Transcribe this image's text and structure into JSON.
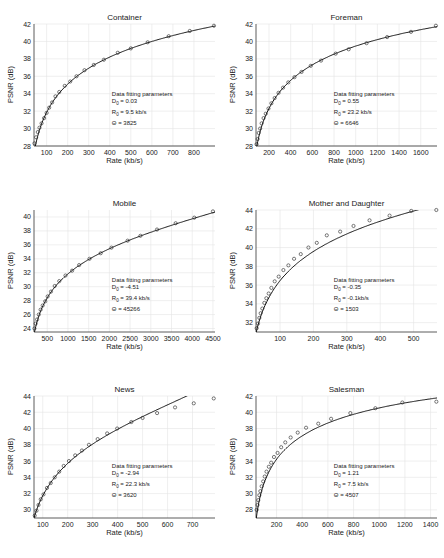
{
  "chart_data": [
    {
      "type": "scatter",
      "title": "Container",
      "xlabel": "Rate (kb/s)",
      "ylabel": "PSNR (dB)",
      "xlim": [
        40,
        900
      ],
      "ylim": [
        28,
        42
      ],
      "xticks": [
        100,
        200,
        300,
        400,
        500,
        600,
        700,
        800
      ],
      "yticks": [
        28,
        30,
        32,
        34,
        36,
        38,
        40,
        42
      ],
      "grid": true,
      "params": {
        "heading": "Data fitting parameters",
        "D0": "D0 = 0.03",
        "R0": "R0 = 9.5 kb/s",
        "theta": "Θ = 3825"
      },
      "fit": {
        "D0": 0.03,
        "R0": 9.5,
        "theta": 3825
      },
      "series": [
        {
          "name": "measured",
          "x": [
            42,
            50,
            58,
            66,
            76,
            88,
            100,
            112,
            126,
            142,
            160,
            186,
            212,
            242,
            280,
            324,
            372,
            438,
            500,
            580,
            680,
            780,
            895
          ],
          "y": [
            28.3,
            29.0,
            29.6,
            30.1,
            30.6,
            31.2,
            31.8,
            32.4,
            33.0,
            33.7,
            34.2,
            34.9,
            35.4,
            36.0,
            36.7,
            37.3,
            37.9,
            38.7,
            39.2,
            39.9,
            40.6,
            41.2,
            41.8
          ]
        }
      ]
    },
    {
      "type": "scatter",
      "title": "Foreman",
      "xlabel": "Rate (kb/s)",
      "ylabel": "PSNR (dB)",
      "xlim": [
        80,
        1750
      ],
      "ylim": [
        28,
        42
      ],
      "xticks": [
        200,
        400,
        600,
        800,
        1000,
        1200,
        1400,
        1600
      ],
      "yticks": [
        28,
        30,
        32,
        34,
        36,
        38,
        40,
        42
      ],
      "grid": true,
      "params": {
        "heading": "Data fitting parameters",
        "D0": "D0 = 0.55",
        "R0": "R0 = 23.2 kb/s",
        "theta": "Θ = 6646"
      },
      "fit": {
        "D0": 0.55,
        "R0": 23.2,
        "theta": 6646
      },
      "series": [
        {
          "name": "measured",
          "x": [
            85,
            95,
            105,
            118,
            132,
            150,
            170,
            195,
            222,
            252,
            288,
            330,
            378,
            435,
            500,
            585,
            680,
            815,
            935,
            1100,
            1290,
            1510,
            1740
          ],
          "y": [
            28.2,
            28.8,
            29.5,
            30.0,
            30.6,
            31.2,
            31.7,
            32.3,
            32.9,
            33.5,
            34.1,
            34.7,
            35.3,
            35.9,
            36.5,
            37.2,
            37.8,
            38.6,
            39.1,
            39.8,
            40.5,
            41.1,
            41.8
          ]
        }
      ]
    },
    {
      "type": "scatter",
      "title": "Mobile",
      "xlabel": "Rate (kb/s)",
      "ylabel": "PSNR (dB)",
      "xlim": [
        180,
        4550
      ],
      "ylim": [
        23.5,
        41
      ],
      "xticks": [
        500,
        1000,
        1500,
        2000,
        2500,
        3000,
        3500,
        4000,
        4500
      ],
      "yticks": [
        24,
        26,
        28,
        30,
        32,
        34,
        36,
        38,
        40
      ],
      "grid": true,
      "params": {
        "heading": "Data fitting parameters",
        "D0": "D0 = -4.51",
        "R0": "R0 = 39.4 kb/s",
        "theta": "Θ = 45266"
      },
      "fit": {
        "D0": -4.51,
        "R0": 39.4,
        "theta": 45266
      },
      "series": [
        {
          "name": "measured",
          "x": [
            190,
            220,
            255,
            295,
            340,
            390,
            450,
            510,
            590,
            680,
            790,
            940,
            1100,
            1270,
            1520,
            1790,
            2050,
            2440,
            2750,
            3150,
            3600,
            4050,
            4500
          ],
          "y": [
            24.0,
            24.7,
            25.3,
            26.0,
            26.7,
            27.3,
            27.9,
            28.6,
            29.3,
            30.1,
            30.8,
            31.6,
            32.3,
            33.1,
            34.0,
            34.8,
            35.6,
            36.6,
            37.3,
            38.2,
            39.1,
            39.9,
            40.8
          ]
        }
      ]
    },
    {
      "type": "scatter",
      "title": "Mother and Daughter",
      "xlabel": "Rate (kb/s)",
      "ylabel": "PSNR (dB)",
      "xlim": [
        28,
        570
      ],
      "ylim": [
        31,
        44
      ],
      "xticks": [
        100,
        200,
        300,
        400,
        500
      ],
      "yticks": [
        32,
        34,
        36,
        38,
        40,
        42,
        44
      ],
      "grid": true,
      "params": {
        "heading": "Data fitting parameters",
        "D0": "D0 = -0.35",
        "R0": "R0 = -0.1kb/s",
        "theta": "Θ = 1503"
      },
      "fit": {
        "D0": -0.35,
        "R0": -0.1,
        "theta": 1503
      },
      "series": [
        {
          "name": "measured",
          "x": [
            30,
            34,
            38,
            42,
            47,
            53,
            59,
            66,
            74,
            84,
            96,
            110,
            125,
            142,
            162,
            185,
            210,
            240,
            280,
            320,
            368,
            428,
            493,
            568
          ],
          "y": [
            31.4,
            31.9,
            32.5,
            33.0,
            33.5,
            34.1,
            34.6,
            35.1,
            35.7,
            36.4,
            36.9,
            37.6,
            38.1,
            38.8,
            39.3,
            40.0,
            40.5,
            41.3,
            41.7,
            42.3,
            42.9,
            43.4,
            43.9,
            44.0
          ]
        }
      ]
    },
    {
      "type": "scatter",
      "title": "News",
      "xlabel": "Rate (kb/s)",
      "ylabel": "PSNR (dB)",
      "xlim": [
        65,
        790
      ],
      "ylim": [
        29,
        44
      ],
      "xticks": [
        100,
        200,
        300,
        400,
        500,
        600,
        700
      ],
      "yticks": [
        30,
        32,
        34,
        36,
        38,
        40,
        42,
        44
      ],
      "grid": true,
      "params": {
        "heading": "Data fitting parameters",
        "D0": "D0 = -2.94",
        "R0": "R0 = 22.3 kb/s",
        "theta": "Θ = 3620"
      },
      "fit": {
        "D0": -2.94,
        "R0": 22.3,
        "theta": 3620
      },
      "series": [
        {
          "name": "measured",
          "x": [
            68,
            75,
            83,
            92,
            103,
            117,
            132,
            148,
            166,
            184,
            205,
            230,
            257,
            285,
            320,
            358,
            398,
            455,
            500,
            558,
            630,
            705,
            785
          ],
          "y": [
            29.3,
            29.9,
            30.6,
            31.3,
            31.9,
            32.7,
            33.3,
            34.0,
            34.7,
            35.4,
            36.0,
            36.7,
            37.3,
            38.0,
            38.7,
            39.4,
            40.0,
            40.8,
            41.3,
            41.9,
            42.6,
            43.1,
            43.7
          ]
        }
      ]
    },
    {
      "type": "scatter",
      "title": "Salesman",
      "xlabel": "Rate (kb/s)",
      "ylabel": "PSNR (dB)",
      "xlim": [
        40,
        1450
      ],
      "ylim": [
        27,
        42
      ],
      "xticks": [
        200,
        400,
        600,
        800,
        1000,
        1200,
        1400
      ],
      "yticks": [
        28,
        30,
        32,
        34,
        36,
        38,
        40,
        42
      ],
      "grid": true,
      "params": {
        "heading": "Data fitting parameters",
        "D0": "D0 = 1.21",
        "R0": "R0 = 7.5 kb/s",
        "theta": "Θ = 4507"
      },
      "fit": {
        "D0": 1.21,
        "R0": 7.5,
        "theta": 4507
      },
      "series": [
        {
          "name": "measured",
          "x": [
            45,
            52,
            58,
            66,
            74,
            84,
            96,
            108,
            122,
            140,
            158,
            180,
            208,
            236,
            268,
            310,
            365,
            430,
            525,
            625,
            775,
            970,
            1180,
            1445
          ],
          "y": [
            28.0,
            28.6,
            29.2,
            29.8,
            30.3,
            30.9,
            31.5,
            32.1,
            32.7,
            33.3,
            33.8,
            34.5,
            35.0,
            35.7,
            36.3,
            36.9,
            37.5,
            38.1,
            38.6,
            39.2,
            39.9,
            40.5,
            41.2,
            41.3
          ]
        }
      ]
    }
  ],
  "layout": {
    "panels": [
      {
        "left": 0,
        "top": 0
      },
      {
        "left": 222,
        "top": 0
      },
      {
        "left": 0,
        "top": 186
      },
      {
        "left": 222,
        "top": 186
      },
      {
        "left": 0,
        "top": 372
      },
      {
        "left": 222,
        "top": 372
      }
    ]
  }
}
